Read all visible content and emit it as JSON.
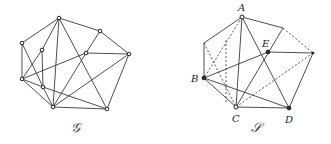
{
  "figure": {
    "left_graph": {
      "label": "𝒢",
      "label_pos": [
        75,
        132
      ],
      "vertices": [
        {
          "id": "v1",
          "x": 59,
          "y": 18
        },
        {
          "id": "v2",
          "x": 100,
          "y": 31
        },
        {
          "id": "v3",
          "x": 22,
          "y": 43
        },
        {
          "id": "v4",
          "x": 42,
          "y": 50
        },
        {
          "id": "v5",
          "x": 86,
          "y": 53
        },
        {
          "id": "v6",
          "x": 129,
          "y": 54
        },
        {
          "id": "v7",
          "x": 22,
          "y": 79
        },
        {
          "id": "v8",
          "x": 43,
          "y": 87
        },
        {
          "id": "v9",
          "x": 53,
          "y": 107
        },
        {
          "id": "v10",
          "x": 107,
          "y": 109
        }
      ],
      "edges": [
        [
          "v1",
          "v2"
        ],
        [
          "v1",
          "v3"
        ],
        [
          "v1",
          "v4"
        ],
        [
          "v1",
          "v9"
        ],
        [
          "v1",
          "v10"
        ],
        [
          "v2",
          "v6"
        ],
        [
          "v2",
          "v5"
        ],
        [
          "v5",
          "v6"
        ],
        [
          "v5",
          "v7"
        ],
        [
          "v5",
          "v9"
        ],
        [
          "v6",
          "v9"
        ],
        [
          "v6",
          "v10"
        ],
        [
          "v3",
          "v7"
        ],
        [
          "v3",
          "v8"
        ],
        [
          "v4",
          "v7"
        ],
        [
          "v4",
          "v8"
        ],
        [
          "v7",
          "v8"
        ],
        [
          "v7",
          "v9"
        ],
        [
          "v8",
          "v9"
        ],
        [
          "v8",
          "v10"
        ],
        [
          "v9",
          "v10"
        ]
      ]
    },
    "right_graph": {
      "label": "𝒮",
      "label_pos": [
        256,
        132
      ],
      "vertices": [
        {
          "id": "A",
          "x": 242,
          "y": 17,
          "label": "A",
          "lx": 238,
          "ly": 11,
          "dot": "open"
        },
        {
          "id": "P1",
          "x": 283,
          "y": 28,
          "label": "",
          "dot": "none"
        },
        {
          "id": "Q",
          "x": 204,
          "y": 43,
          "label": "",
          "dot": "none"
        },
        {
          "id": "E",
          "x": 268,
          "y": 52,
          "label": "E",
          "lx": 262,
          "ly": 47,
          "dot": "filled"
        },
        {
          "id": "R",
          "x": 313,
          "y": 53,
          "label": "",
          "dot": "small"
        },
        {
          "id": "B",
          "x": 204,
          "y": 78,
          "label": "B",
          "lx": 191,
          "ly": 82,
          "dot": "filled"
        },
        {
          "id": "C",
          "x": 236,
          "y": 107,
          "label": "C",
          "lx": 232,
          "ly": 122,
          "dot": "open"
        },
        {
          "id": "D",
          "x": 289,
          "y": 108,
          "label": "D",
          "lx": 285,
          "ly": 123,
          "dot": "filled"
        }
      ],
      "solid_edges": [
        [
          "A",
          "P1"
        ],
        [
          "A",
          "Q"
        ],
        [
          "Q",
          "B"
        ],
        [
          "A",
          "C"
        ],
        [
          "A",
          "D"
        ],
        [
          "P1",
          "C"
        ],
        [
          "E",
          "R"
        ],
        [
          "R",
          "D"
        ],
        [
          "B",
          "E"
        ],
        [
          "B",
          "C"
        ],
        [
          "B",
          "D"
        ],
        [
          "C",
          "D"
        ]
      ],
      "dashed_edges": [
        [
          [
            242,
            17
          ],
          [
            204,
            78
          ]
        ],
        [
          [
            204,
            43
          ],
          [
            236,
            107
          ]
        ],
        [
          [
            226,
            40
          ],
          [
            226,
            103
          ]
        ],
        [
          [
            283,
            28
          ],
          [
            313,
            53
          ]
        ],
        [
          [
            236,
            107
          ],
          [
            313,
            53
          ]
        ]
      ]
    }
  }
}
